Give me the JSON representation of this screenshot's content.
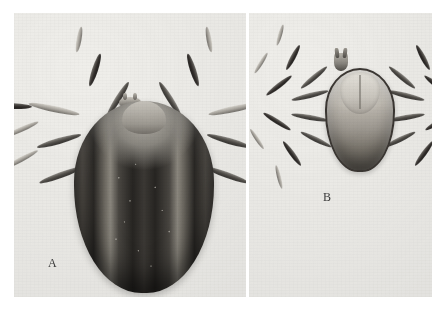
{
  "plate": {
    "background_color": "#efeeea",
    "page_color": "#ffffff",
    "panels": [
      {
        "id": "A",
        "label": "A",
        "subject": "engorged-tick-dorsal",
        "description": "Engorged female tick, dorsal view, with dark ovoid idiosoma bearing pale longitudinal stripes and scattered light speckles",
        "leg_count": 8
      },
      {
        "id": "B",
        "label": "B",
        "subject": "unengorged-tick-dorsal",
        "description": "Unengorged tick, dorsal view, with pale scutum, dark marginal outline and eight splayed banded legs",
        "leg_count": 8
      }
    ]
  },
  "labels": {
    "figure_a": "A",
    "figure_b": "B"
  },
  "colors": {
    "paper": "#efeeea",
    "ink_dark": "#2b2926",
    "ink_mid": "#7d786f",
    "ink_pale": "#d8d5cd",
    "label_text": "#3b3b3b"
  }
}
